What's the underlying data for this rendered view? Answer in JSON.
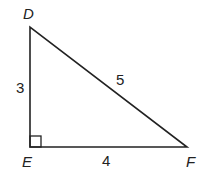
{
  "diagram": {
    "type": "right-triangle",
    "vertices": {
      "D": {
        "label": "D",
        "x": 30,
        "y": 27
      },
      "E": {
        "label": "E",
        "x": 30,
        "y": 147
      },
      "F": {
        "label": "F",
        "x": 187,
        "y": 147
      }
    },
    "sides": {
      "DE": "3",
      "EF": "4",
      "DF": "5"
    },
    "right_angle_at": "E",
    "colors": {
      "stroke": "#222222",
      "background": "#ffffff"
    }
  }
}
